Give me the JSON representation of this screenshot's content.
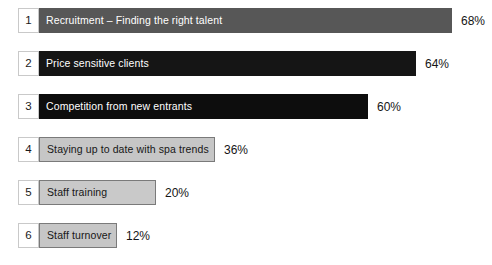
{
  "chart_data": {
    "type": "bar",
    "title": "",
    "subtitle": "",
    "xlabel": "",
    "ylabel": "",
    "orientation": "horizontal",
    "grid": false,
    "legend": "none",
    "xlim": [
      0,
      100
    ],
    "value_suffix": "%",
    "categories": [
      "Recruitment – Finding the right talent",
      "Price sensitive clients",
      "Competition from new entrants",
      "Staying up to date with spa trends",
      "Staff training",
      "Staff turnover"
    ],
    "values": [
      68,
      64,
      60,
      36,
      20,
      12
    ],
    "value_labels": [
      "68%",
      "64%",
      "60%",
      "36%",
      "20%",
      "12%"
    ],
    "ranks": [
      "1",
      "2",
      "3",
      "4",
      "5",
      "6"
    ]
  },
  "rows": [
    {
      "rank": "1",
      "label": "Recruitment – Finding the right talent",
      "value": "68%",
      "bar_color": "#575757",
      "text_color": "#ffffff",
      "style": "dark"
    },
    {
      "rank": "2",
      "label": "Price sensitive clients",
      "value": "64%",
      "bar_color": "#151515",
      "text_color": "#ffffff",
      "style": "dark"
    },
    {
      "rank": "3",
      "label": "Competition from new entrants",
      "value": "60%",
      "bar_color": "#0d0d0d",
      "text_color": "#ffffff",
      "style": "dark"
    },
    {
      "rank": "4",
      "label": "Staying up to date with spa trends",
      "value": "36%",
      "bar_color": "#c6c6c6",
      "text_color": "#161616",
      "style": "light"
    },
    {
      "rank": "5",
      "label": "Staff training",
      "value": "20%",
      "bar_color": "#c9c9c9",
      "text_color": "#161616",
      "style": "light"
    },
    {
      "rank": "6",
      "label": "Staff turnover",
      "value": "12%",
      "bar_color": "#c6c6c6",
      "text_color": "#161616",
      "style": "light"
    }
  ],
  "layout": {
    "row_tops": [
      8,
      51,
      94,
      137,
      180,
      223
    ],
    "bar_widths": [
      413,
      377,
      329,
      176,
      117,
      78
    ],
    "rank_box_width": 21
  }
}
